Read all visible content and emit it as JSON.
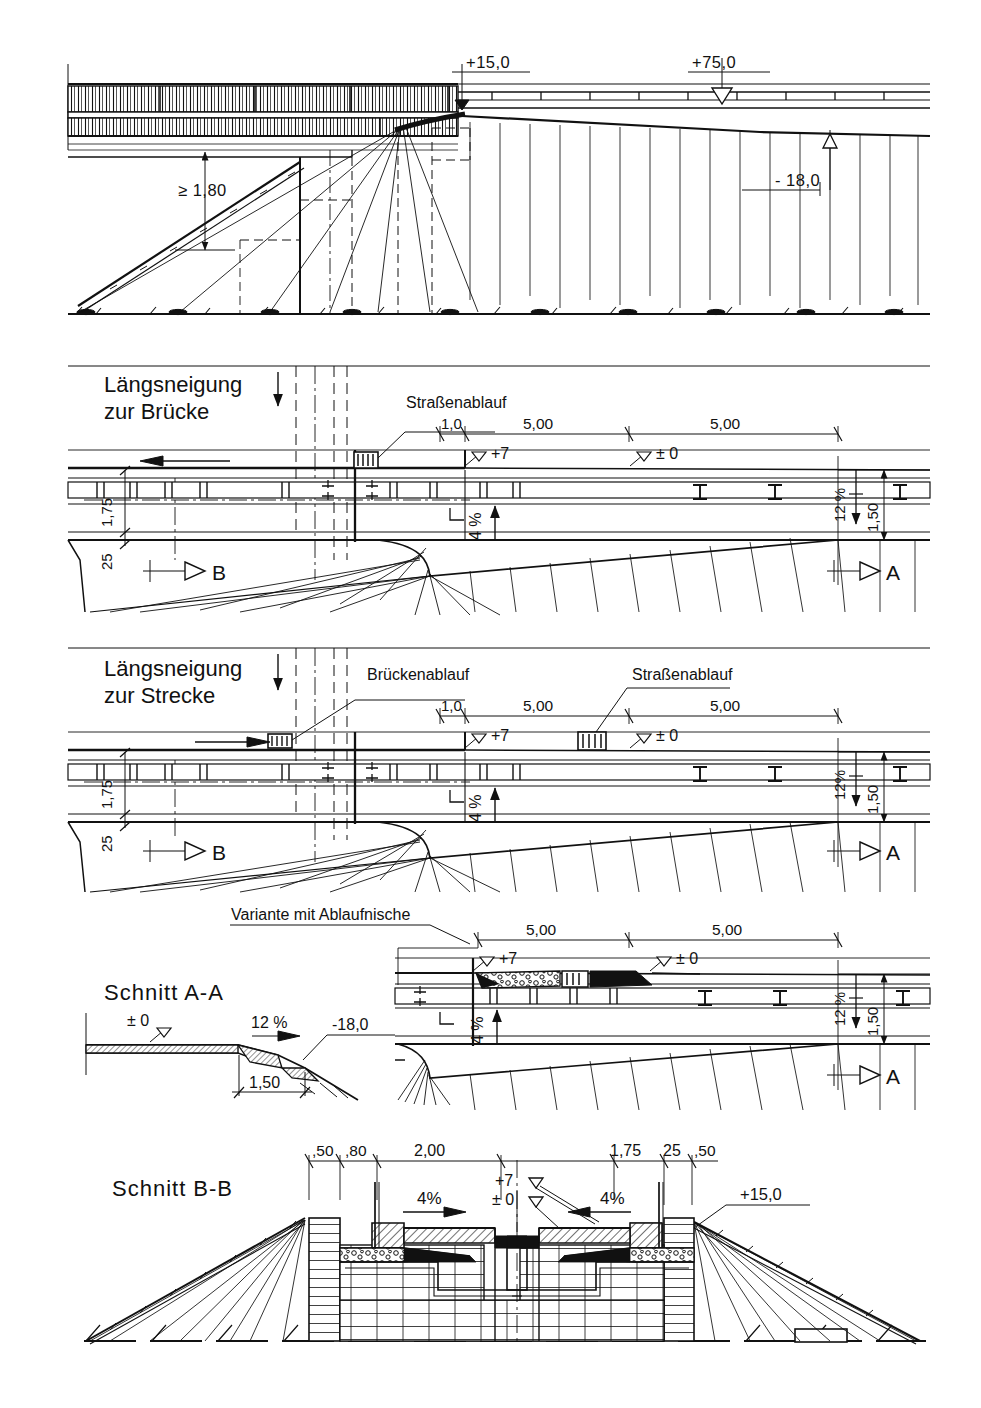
{
  "document": {
    "type": "engineering-drawing",
    "language": "de",
    "sheet_width": 981,
    "sheet_height": 1408,
    "background_color": "#ffffff",
    "line_color": "#111111"
  },
  "views": [
    {
      "id": "view-longitudinal-overview",
      "name": "bridge-abutment-longitudinal-overview",
      "title": "",
      "labels": [
        {
          "name": "level-plus-15",
          "text": "+15,0"
        },
        {
          "name": "level-plus-75",
          "text": "+75,0"
        },
        {
          "name": "level-minus-18",
          "text": "- 18,0"
        },
        {
          "name": "min-clearance",
          "text": "≥ 1,80"
        }
      ]
    },
    {
      "id": "view-slope-to-bridge",
      "name": "laengsneigung-zur-bruecke",
      "title_line_1": "Längsneigung",
      "title_line_2": "zur Brücke",
      "callouts": [
        {
          "name": "callout-strassenablauf",
          "text": "Straßenablauf"
        }
      ],
      "dimensions": [
        {
          "name": "dim-1-0",
          "text": "1,0"
        },
        {
          "name": "dim-5-00-a",
          "text": "5,00"
        },
        {
          "name": "dim-5-00-b",
          "text": "5,00"
        },
        {
          "name": "dim-1-75",
          "text": "1,75"
        },
        {
          "name": "dim-25",
          "text": "25"
        },
        {
          "name": "dim-1-50",
          "text": "1,50"
        }
      ],
      "levels": [
        {
          "name": "level-plus-7",
          "text": "+7"
        },
        {
          "name": "level-zero",
          "text": "± 0"
        }
      ],
      "slopes": [
        {
          "name": "slope-4-percent",
          "text": "4 %"
        },
        {
          "name": "slope-12-percent",
          "text": "12 %"
        }
      ],
      "section_marks": [
        {
          "name": "section-mark-b",
          "text": "B"
        },
        {
          "name": "section-mark-a",
          "text": "A"
        }
      ]
    },
    {
      "id": "view-slope-to-road",
      "name": "laengsneigung-zur-strecke",
      "title_line_1": "Längsneigung",
      "title_line_2": "zur Strecke",
      "callouts": [
        {
          "name": "callout-brueckenablauf",
          "text": "Brückenablauf"
        },
        {
          "name": "callout-strassenablauf",
          "text": "Straßenablauf"
        }
      ],
      "dimensions": [
        {
          "name": "dim-1-0",
          "text": "1,0"
        },
        {
          "name": "dim-5-00-a",
          "text": "5,00"
        },
        {
          "name": "dim-5-00-b",
          "text": "5,00"
        },
        {
          "name": "dim-1-75",
          "text": "1,75"
        },
        {
          "name": "dim-25",
          "text": "25"
        },
        {
          "name": "dim-1-50",
          "text": "1,50"
        }
      ],
      "levels": [
        {
          "name": "level-plus-7",
          "text": "+7"
        },
        {
          "name": "level-zero",
          "text": "± 0"
        }
      ],
      "slopes": [
        {
          "name": "slope-4-percent",
          "text": "4 %"
        },
        {
          "name": "slope-12-percent",
          "text": "12%"
        }
      ],
      "section_marks": [
        {
          "name": "section-mark-b",
          "text": "B"
        },
        {
          "name": "section-mark-a",
          "text": "A"
        }
      ]
    },
    {
      "id": "view-section-a-a",
      "name": "schnitt-a-a",
      "title": "Schnitt A-A",
      "labels": [
        {
          "name": "level-zero",
          "text": "± 0"
        },
        {
          "name": "slope-12-percent",
          "text": "12 %"
        },
        {
          "name": "level-minus-18",
          "text": "-18,0"
        },
        {
          "name": "dim-1-50",
          "text": "1,50"
        }
      ]
    },
    {
      "id": "view-variant-drain-niche",
      "name": "variante-mit-ablaufnische",
      "title": "Variante mit Ablaufnische",
      "dimensions": [
        {
          "name": "dim-5-00-a",
          "text": "5,00"
        },
        {
          "name": "dim-5-00-b",
          "text": "5,00"
        },
        {
          "name": "dim-1-50",
          "text": "1,50"
        }
      ],
      "levels": [
        {
          "name": "level-plus-7",
          "text": "+7"
        },
        {
          "name": "level-zero",
          "text": "± 0"
        }
      ],
      "slopes": [
        {
          "name": "slope-4-percent",
          "text": "4 %"
        },
        {
          "name": "slope-12-percent",
          "text": "12 %"
        }
      ],
      "section_marks": [
        {
          "name": "section-mark-a",
          "text": "A"
        }
      ]
    },
    {
      "id": "view-section-b-b",
      "name": "schnitt-b-b",
      "title": "Schnitt B-B",
      "dimensions": [
        {
          "name": "dim-50-left",
          "text": ",50"
        },
        {
          "name": "dim-80",
          "text": ",80"
        },
        {
          "name": "dim-2-00",
          "text": "2,00"
        },
        {
          "name": "dim-1-75",
          "text": "1,75"
        },
        {
          "name": "dim-25",
          "text": "25"
        },
        {
          "name": "dim-50-right",
          "text": ",50"
        }
      ],
      "levels": [
        {
          "name": "level-plus-7",
          "text": "+7"
        },
        {
          "name": "level-zero",
          "text": "± 0"
        },
        {
          "name": "level-plus-15",
          "text": "+15,0"
        }
      ],
      "slopes": [
        {
          "name": "slope-4-percent-left",
          "text": "4%"
        },
        {
          "name": "slope-4-percent-right",
          "text": "4%"
        }
      ]
    }
  ]
}
